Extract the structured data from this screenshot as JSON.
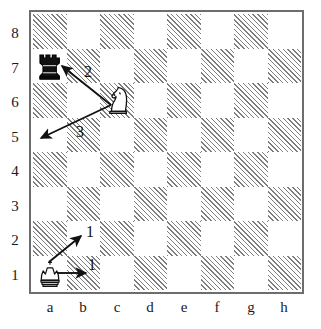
{
  "diagram": {
    "board": {
      "files": [
        "a",
        "b",
        "c",
        "d",
        "e",
        "f",
        "g",
        "h"
      ],
      "ranks": [
        "8",
        "7",
        "6",
        "5",
        "4",
        "3",
        "2",
        "1"
      ],
      "light_color": "#ffffff",
      "dark_color": "#7d7d7d",
      "border_color": "#6d6d6d",
      "dark_square_style": "diagonal-hatch"
    },
    "pieces": [
      {
        "id": "black-rook-a7",
        "type": "rook",
        "color": "black",
        "square": "a7",
        "file": 0,
        "rank": 7,
        "glyph": "♜"
      },
      {
        "id": "white-knight-c6",
        "type": "knight",
        "color": "white",
        "square": "c6",
        "file": 2,
        "rank": 6,
        "glyph": "♘"
      },
      {
        "id": "white-king-a1",
        "type": "king",
        "color": "white",
        "square": "a1",
        "file": 0,
        "rank": 1,
        "glyph": "♔"
      }
    ],
    "arrows": [
      {
        "id": "arrow-knight-to-a7",
        "label": "2",
        "from": "c6",
        "to": "a7",
        "label_x": 84,
        "label_y": 64,
        "x1": 111,
        "y1": 105,
        "x2": 62,
        "y2": 66
      },
      {
        "id": "arrow-knight-to-a5",
        "label": "3",
        "from": "c6",
        "to": "a5",
        "label_x": 76,
        "label_y": 124,
        "x1": 111,
        "y1": 105,
        "x2": 41,
        "y2": 138
      },
      {
        "id": "arrow-king-to-b2",
        "label": "1",
        "from": "a1",
        "to": "b2",
        "label_x": 86,
        "label_y": 224,
        "x1": 49,
        "y1": 262,
        "x2": 81,
        "y2": 236
      },
      {
        "id": "arrow-king-to-b1",
        "label": "1",
        "from": "a1",
        "to": "b1",
        "label_x": 88,
        "label_y": 257,
        "x1": 57,
        "y1": 273,
        "x2": 86,
        "y2": 273
      }
    ]
  }
}
